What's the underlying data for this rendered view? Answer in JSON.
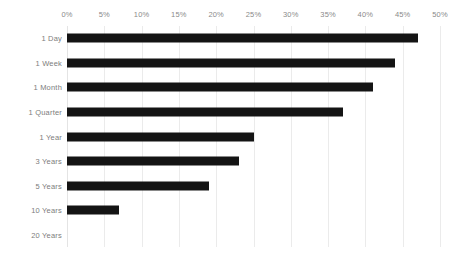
{
  "chart": {
    "background_color": "#ffffff",
    "bar_color": "#141414",
    "gridline_color": "#ebebeb",
    "axis_label_color": "#8a8a8a"
  },
  "chart_data": {
    "type": "bar",
    "orientation": "horizontal",
    "title": "",
    "xlabel": "",
    "ylabel": "",
    "xlim": [
      0,
      50
    ],
    "grid": true,
    "legend": "none",
    "x_tick_labels": [
      "0%",
      "5%",
      "10%",
      "15%",
      "20%",
      "25%",
      "30%",
      "35%",
      "40%",
      "45%",
      "50%"
    ],
    "x_ticks": [
      0,
      5,
      10,
      15,
      20,
      25,
      30,
      35,
      40,
      45,
      50
    ],
    "categories": [
      "1 Day",
      "1 Week",
      "1 Month",
      "1 Quarter",
      "1 Year",
      "3 Years",
      "5 Years",
      "10 Years",
      "20 Years"
    ],
    "values": [
      47,
      44,
      41,
      37,
      25,
      23,
      19,
      7,
      0
    ],
    "value_unit": "%"
  }
}
